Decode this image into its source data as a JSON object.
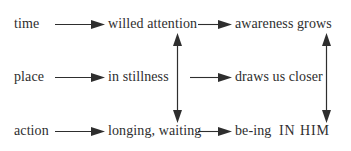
{
  "diagram": {
    "type": "flow-diagram",
    "background_color": "#ffffff",
    "text_color": "#2e2e2e",
    "rows": [
      {
        "id": "row-time",
        "label": "time",
        "middle": "willed attention",
        "right": "awareness grows"
      },
      {
        "id": "row-place",
        "label": "place",
        "middle": "in stillness",
        "right": "draws us closer"
      },
      {
        "id": "row-action",
        "label": "action",
        "middle": "longing, waiting",
        "right_prefix": "be-ing",
        "right_caps": "IN HIM"
      }
    ],
    "arrows": {
      "horizontal": [
        {
          "id": "time-to-willed-attention",
          "from": "time",
          "to": "willed attention",
          "direction": "right"
        },
        {
          "id": "willed-attention-to-awareness-grows",
          "from": "willed attention",
          "to": "awareness grows",
          "direction": "right"
        },
        {
          "id": "place-to-in-stillness",
          "from": "place",
          "to": "in stillness",
          "direction": "right"
        },
        {
          "id": "to-draws-us-closer",
          "from": "",
          "to": "draws us closer",
          "direction": "right"
        },
        {
          "id": "action-to-longing-waiting",
          "from": "action",
          "to": "longing, waiting",
          "direction": "right"
        },
        {
          "id": "longing-waiting-to-be-ing-in-him",
          "from": "longing, waiting",
          "to": "be-ing IN HIM",
          "direction": "right"
        }
      ],
      "vertical": [
        {
          "id": "middle-column-link",
          "connects": [
            "willed attention",
            "longing, waiting"
          ],
          "direction": "both"
        },
        {
          "id": "right-column-link",
          "connects": [
            "awareness grows",
            "be-ing IN HIM"
          ],
          "direction": "both"
        }
      ]
    }
  }
}
